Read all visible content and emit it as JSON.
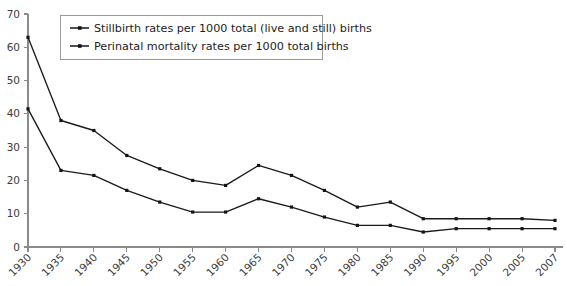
{
  "chart_data": {
    "type": "line",
    "title": "",
    "xlabel": "",
    "ylabel": "",
    "ylim": [
      0,
      70
    ],
    "ytick_step": 10,
    "yticks": [
      0,
      10,
      20,
      30,
      40,
      50,
      60,
      70
    ],
    "grid": false,
    "legend_position": "top-left",
    "categories": [
      "1930",
      "1935",
      "1940",
      "1945",
      "1950",
      "1955",
      "1960",
      "1965",
      "1970",
      "1975",
      "1980",
      "1985",
      "1990",
      "1995",
      "2000",
      "2005",
      "2007"
    ],
    "x": [
      1930,
      1935,
      1940,
      1945,
      1950,
      1955,
      1960,
      1965,
      1970,
      1975,
      1980,
      1985,
      1990,
      1995,
      2000,
      2005,
      2007
    ],
    "series": [
      {
        "name": "Perinatal mortality rates per 1000 total births",
        "values": [
          63,
          38,
          35,
          27.5,
          23.5,
          20,
          18.5,
          24.5,
          21.5,
          17,
          12,
          13.5,
          8.5,
          8.5,
          8.5,
          8.5,
          8
        ]
      },
      {
        "name": "Stillbirth rates per 1000 total (live and still) births",
        "values": [
          41.5,
          23,
          21.5,
          17,
          13.5,
          10.5,
          10.5,
          14.5,
          12,
          9,
          6.5,
          6.5,
          4.5,
          5.5,
          5.5,
          5.5,
          5.5
        ]
      }
    ],
    "legend_entries": [
      "Stillbirth rates per 1000 total (live and still) births",
      "Perinatal mortality rates per 1000 total births"
    ],
    "colors": {
      "series_line": "#141414",
      "axis": "#8a8a8a",
      "tick_label": "#3b3b3b",
      "legend_border": "#9a9a9a",
      "background": "#ffffff"
    }
  },
  "watermark": {
    "text": ""
  }
}
